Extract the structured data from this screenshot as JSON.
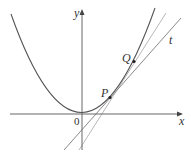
{
  "diagram": {
    "type": "parabola-tangent-secant",
    "axes": {
      "x_label": "x",
      "y_label": "y",
      "origin_label": "0"
    },
    "curve": {
      "equation_hint": "y = x^2 (parabola)",
      "color": "#555555"
    },
    "points": [
      {
        "name": "P",
        "label": "P"
      },
      {
        "name": "Q",
        "label": "Q"
      }
    ],
    "lines": [
      {
        "name": "tangent",
        "label": "t",
        "color": "#888888"
      },
      {
        "name": "secant",
        "label": "",
        "color": "#aaaaaa"
      }
    ],
    "colors": {
      "axis": "#666666",
      "curve": "#555555",
      "tangent": "#8a8a8a",
      "secant": "#b5b5b5",
      "point": "#222222",
      "text": "#333333"
    }
  }
}
